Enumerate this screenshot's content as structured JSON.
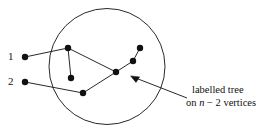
{
  "figure": {
    "background_color": "#ffffff",
    "ink_color": "#111111"
  },
  "labels": {
    "vertex_one": "1",
    "vertex_two": "2"
  },
  "caption": {
    "line1": "labelled tree",
    "line2_prefix": "on ",
    "line2_var": "n",
    "line2_suffix": " − 2 vertices",
    "full_text": "labelled tree on n − 2 vertices"
  },
  "diagram": {
    "circle": {
      "cx": 107,
      "cy": 66.5,
      "r": 58
    },
    "external_vertices": [
      {
        "name": "vertex-1",
        "x": 25,
        "y": 57
      },
      {
        "name": "vertex-2",
        "x": 25,
        "y": 82
      }
    ],
    "tree_vertices": [
      {
        "name": "node-a",
        "x": 68,
        "y": 48
      },
      {
        "name": "node-b",
        "x": 71,
        "y": 78
      },
      {
        "name": "node-c",
        "x": 83,
        "y": 93
      },
      {
        "name": "node-d",
        "x": 116,
        "y": 72
      },
      {
        "name": "node-e",
        "x": 133,
        "y": 61
      },
      {
        "name": "node-f",
        "x": 140,
        "y": 48
      }
    ],
    "edges": [
      {
        "from": "vertex-1",
        "to": "node-a",
        "x1": 25,
        "y1": 57,
        "x2": 68,
        "y2": 48
      },
      {
        "from": "vertex-2",
        "to": "node-c",
        "x1": 25,
        "y1": 82,
        "x2": 83,
        "y2": 93
      },
      {
        "from": "node-a",
        "to": "node-b",
        "x1": 68,
        "y1": 48,
        "x2": 71,
        "y2": 78
      },
      {
        "from": "node-a",
        "to": "node-d",
        "x1": 68,
        "y1": 48,
        "x2": 116,
        "y2": 72
      },
      {
        "from": "node-c",
        "to": "node-d",
        "x1": 83,
        "y1": 93,
        "x2": 116,
        "y2": 72
      },
      {
        "from": "node-d",
        "to": "node-e",
        "x1": 116,
        "y1": 72,
        "x2": 133,
        "y2": 61
      },
      {
        "from": "node-e",
        "to": "node-f",
        "x1": 133,
        "y1": 61,
        "x2": 140,
        "y2": 48
      }
    ],
    "annotation_arrow": {
      "x1": 187,
      "y1": 98,
      "x2": 131,
      "y2": 76
    },
    "vertex_radius": 3.2
  }
}
